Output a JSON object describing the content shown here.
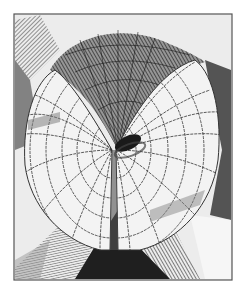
{
  "figure": {
    "kind": "engraving-style illustration of a mathematical surface (wireframe with hatching)",
    "frame": {
      "x": 14,
      "y": 14,
      "width": 218,
      "height": 266,
      "stroke": "#555555"
    },
    "colors": {
      "background": "#ffffff",
      "paper": "#eeeeee",
      "dark": "#2a2a2a",
      "mid": "#7a7a7a",
      "light": "#f2f2f2",
      "grid": "#333333"
    }
  }
}
